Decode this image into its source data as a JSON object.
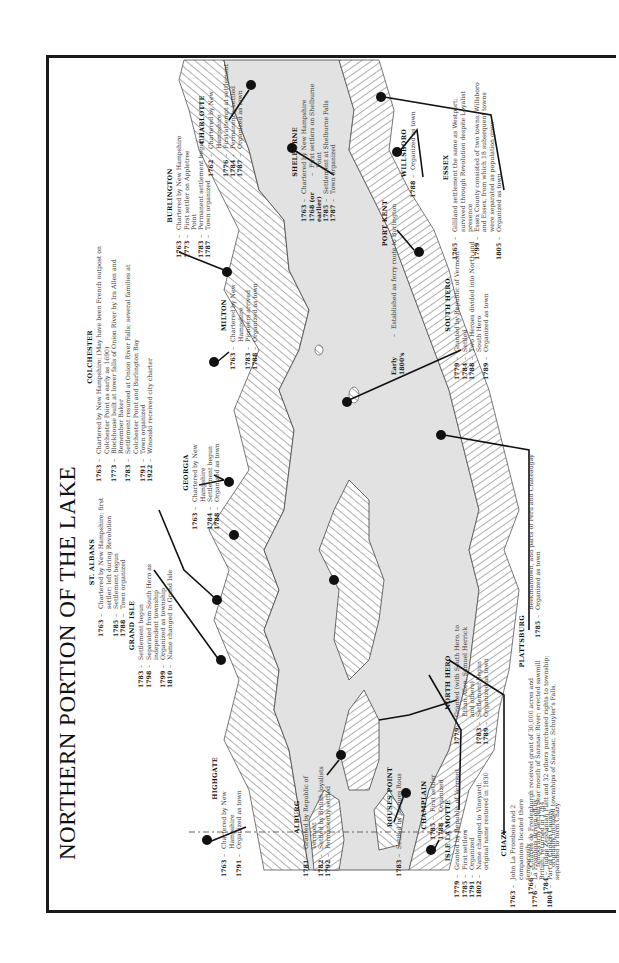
{
  "title": "NORTHERN PORTION OF THE LAKE",
  "towns": {
    "st_albans": {
      "name": "ST. ALBANS",
      "events": [
        {
          "year": "1763",
          "text": "Chartered by New Hampshire; first settler; left during Revolution"
        },
        {
          "year": "1785",
          "text": "Settlement begun"
        },
        {
          "year": "1788",
          "text": "Town organized"
        }
      ]
    },
    "grand_isle": {
      "name": "GRAND ISLE",
      "events": [
        {
          "year": "1783",
          "text": "Settlement begun"
        },
        {
          "year": "1798",
          "text": "Separated from South Hero as independent township"
        },
        {
          "year": "1799",
          "text": "Organized as township"
        },
        {
          "year": "1810",
          "text": "Name changed to Grand Isle"
        }
      ]
    },
    "colchester": {
      "name": "COLCHESTER",
      "events": [
        {
          "year": "1763",
          "text": "Chartered by New Hampshire; (May have been French outpost on Colchester Point as early as 1690)"
        },
        {
          "year": "1773",
          "text": "Blockhouse built at lower falls of Onion River by Ira Allen and Remember Baker"
        },
        {
          "year": "1783",
          "text": "Settlement resumed at Onion River Falls; several families at Colchester Point and Burlington Bay"
        },
        {
          "year": "1791",
          "text": "Town organized"
        },
        {
          "year": "1922",
          "text": "Winooski received city charter"
        }
      ]
    },
    "georgia": {
      "name": "GEORGIA",
      "events": [
        {
          "year": "1763",
          "text": "Chartered by New Hampshire"
        },
        {
          "year": "1784",
          "text": "Settlement begun"
        },
        {
          "year": "1788",
          "text": "Organized as town"
        }
      ]
    },
    "milton": {
      "name": "MILTON",
      "events": [
        {
          "year": "1763",
          "text": "Chartered by New Hampshire"
        },
        {
          "year": "1783",
          "text": "Pioneers arrived"
        },
        {
          "year": "1788",
          "text": "Organized as town"
        }
      ]
    },
    "burlington": {
      "name": "BURLINGTON",
      "events": [
        {
          "year": "1763",
          "text": "Chartered by New Hampshire"
        },
        {
          "year": "1773",
          "text": "First settler on Appletree Point"
        },
        {
          "year": "1783",
          "text": "Permanent settlement begun"
        },
        {
          "year": "1787",
          "text": "Town organized"
        }
      ]
    },
    "charlotte": {
      "name": "CHARLOTTE",
      "events": [
        {
          "year": "1762",
          "text": "Chartered by New Hampshire"
        },
        {
          "year": "1776",
          "text": "First attempt at settlement"
        },
        {
          "year": "1784",
          "text": "Permanently settled"
        },
        {
          "year": "1787",
          "text": "Organized as town"
        }
      ]
    },
    "shelburne": {
      "name": "SHELBURNE",
      "events": [
        {
          "year": "1763",
          "text": "Chartered by New Hampshire"
        },
        {
          "year": "1768 (or earlier)",
          "text": "First settlers on Shelburne Point"
        },
        {
          "year": "1785",
          "text": "Settlement at Shelburne Falls"
        },
        {
          "year": "1787",
          "text": "Town organized"
        }
      ]
    },
    "willsboro": {
      "name": "WILLSBORO",
      "events": [
        {
          "year": "1788",
          "text": "Organized as town"
        }
      ]
    },
    "port_kent": {
      "name": "PORT KENT",
      "events": [
        {
          "year": "Early 1800's",
          "text": "Established as ferry route to Burlington"
        }
      ]
    },
    "essex": {
      "name": "ESSEX",
      "events": [
        {
          "year": "1765",
          "text": "Gilliland settlement the same as Westport; survived through Revolution despite Loyalist presence"
        },
        {
          "year": "1799",
          "text": "Essex County consisted of two towns, Willsboro and Essex, from which 18 subsequent towns were separated as population grew"
        },
        {
          "year": "1805",
          "text": "Organized as town"
        }
      ]
    },
    "south_hero": {
      "name": "SOUTH HERO",
      "events": [
        {
          "year": "1779",
          "text": "Granted by Republic of Vermont"
        },
        {
          "year": "1784",
          "text": "Settled"
        },
        {
          "year": "1788",
          "text": "Two Heroes divided into North and South Hero"
        },
        {
          "year": "1789",
          "text": "Organized as town"
        }
      ]
    },
    "north_hero": {
      "name": "NORTH HERO",
      "events": [
        {
          "year": "1779",
          "text": "Granted (with South Hero, to Ethan Allen, Samuel Herrick and others)"
        },
        {
          "year": "1783",
          "text": "Settlement begun"
        },
        {
          "year": "1789",
          "text": "Organized as town"
        }
      ]
    },
    "plattsburg": {
      "name": "PLATTSBURG",
      "events": [
        {
          "year": "1766",
          "text": "Charles de Fredenburgh received grant of 30,000 acres and temporarily settled near mouth of Saranac River; erected sawmill"
        },
        {
          "year": "1784",
          "text": "Judge Zephaniah Platt and 32 others purchased rights to township; originally included townships of Saranac, Schuyler's Falls, Beekmantown, and parts of Peru and Chateaugay"
        },
        {
          "year": "1785",
          "text": "Organized as town"
        }
      ]
    },
    "highgate": {
      "name": "HIGHGATE",
      "events": [
        {
          "year": "1763",
          "text": "Chartered by New Hampshire"
        },
        {
          "year": "1791",
          "text": "Organized as town"
        }
      ]
    },
    "alburg": {
      "name": "ALBURG",
      "events": [
        {
          "year": "1781",
          "text": "Granted by Republic of Vermont"
        },
        {
          "year": "1782",
          "text": "Settled by British loyalists"
        },
        {
          "year": "1792",
          "text": "Permanently settled"
        }
      ]
    },
    "rouses_point": {
      "name": "ROUSES POINT",
      "events": [
        {
          "year": "1783",
          "text": "Settled by Jacques Rous"
        }
      ]
    },
    "champlain": {
      "name": "CHAMPLAIN",
      "events": [
        {
          "year": "1785",
          "text": "First settler"
        },
        {
          "year": "1788",
          "text": "Organized"
        }
      ]
    },
    "isle_la_motte": {
      "name": "ISLE LA MOTTE",
      "events": [
        {
          "year": "1779",
          "text": "Granted by Republic of Vermont"
        },
        {
          "year": "1785",
          "text": "First settlers"
        },
        {
          "year": "1791",
          "text": "Organized"
        },
        {
          "year": "1802",
          "text": "Name changed to Vineyard; original name restored in 1830"
        }
      ]
    },
    "chazy": {
      "name": "CHAZY",
      "events": [
        {
          "year": "1763",
          "text": "John La Frombois and 2 companions located there temporarily"
        },
        {
          "year": "1776",
          "text": "La Frombois driven off by British; returned in 1784"
        },
        {
          "year": "1804",
          "text": "Part of Clinton County separated to form Chazy"
        }
      ]
    }
  },
  "colors": {
    "water": "#e2e2e2",
    "shore_hatch": "#777777",
    "ink": "#111111",
    "border": "#1a1a1a"
  }
}
